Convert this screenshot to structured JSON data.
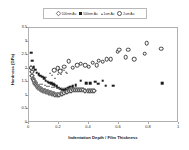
{
  "chart_data": {
    "type": "scatter",
    "title": "",
    "xlabel": "Indentation Depth / Film Thickness",
    "ylabel": "Hardness (GPa)",
    "xlim": [
      0,
      1
    ],
    "ylim": [
      0,
      3.5
    ],
    "grid": false,
    "legend_position": "top-center",
    "xticks": [
      "0",
      "0.2",
      "0.4",
      "0.6",
      "0.8",
      "1"
    ],
    "xtick_values": [
      0,
      0.2,
      0.4,
      0.6,
      0.8,
      1
    ],
    "yticks": [
      "0",
      "0.5",
      "1",
      "1.5",
      "2",
      "2.5",
      "3",
      "3.5"
    ],
    "ytick_values": [
      0,
      0.5,
      1,
      1.5,
      2,
      2.5,
      3,
      3.5
    ],
    "series": [
      {
        "name": "100nm Au",
        "marker": "open-diamond",
        "color": "#4a4a4a",
        "points": [
          [
            0.012,
            2.02
          ],
          [
            0.018,
            1.88
          ],
          [
            0.022,
            1.72
          ],
          [
            0.028,
            1.62
          ],
          [
            0.032,
            1.55
          ],
          [
            0.038,
            1.48
          ],
          [
            0.042,
            1.44
          ],
          [
            0.048,
            1.4
          ],
          [
            0.052,
            1.36
          ],
          [
            0.058,
            1.33
          ],
          [
            0.062,
            1.3
          ],
          [
            0.068,
            1.28
          ],
          [
            0.072,
            1.26
          ],
          [
            0.078,
            1.24
          ],
          [
            0.082,
            1.22
          ],
          [
            0.088,
            1.21
          ],
          [
            0.094,
            1.19
          ],
          [
            0.1,
            1.18
          ],
          [
            0.106,
            1.17
          ],
          [
            0.112,
            1.16
          ],
          [
            0.118,
            1.15
          ],
          [
            0.124,
            1.14
          ],
          [
            0.13,
            1.12
          ],
          [
            0.136,
            1.11
          ],
          [
            0.142,
            1.1
          ],
          [
            0.148,
            1.09
          ],
          [
            0.154,
            1.08
          ],
          [
            0.16,
            1.07
          ],
          [
            0.168,
            1.06
          ],
          [
            0.176,
            1.05
          ],
          [
            0.184,
            1.04
          ],
          [
            0.192,
            1.04
          ],
          [
            0.2,
            1.05
          ],
          [
            0.21,
            1.06
          ],
          [
            0.22,
            1.08
          ],
          [
            0.232,
            1.1
          ],
          [
            0.244,
            1.13
          ],
          [
            0.256,
            1.15
          ],
          [
            0.268,
            1.17
          ],
          [
            0.28,
            1.19
          ],
          [
            0.292,
            1.2
          ],
          [
            0.306,
            1.21
          ],
          [
            0.32,
            1.22
          ],
          [
            0.334,
            1.22
          ],
          [
            0.348,
            1.21
          ],
          [
            0.362,
            1.2
          ],
          [
            0.376,
            1.19
          ],
          [
            0.39,
            1.18
          ],
          [
            0.404,
            1.17
          ],
          [
            0.418,
            1.17
          ],
          [
            0.432,
            1.17
          ]
        ]
      },
      {
        "name": "500nm Au",
        "marker": "filled-square",
        "color": "#1c1c1c",
        "points": [
          [
            0.014,
            2.59
          ],
          [
            0.02,
            2.3
          ],
          [
            0.03,
            2.06
          ],
          [
            0.04,
            1.96
          ],
          [
            0.052,
            1.86
          ],
          [
            0.064,
            1.8
          ],
          [
            0.076,
            1.74
          ],
          [
            0.088,
            1.7
          ],
          [
            0.1,
            1.64
          ],
          [
            0.112,
            1.56
          ],
          [
            0.124,
            1.52
          ],
          [
            0.136,
            1.48
          ],
          [
            0.148,
            1.46
          ],
          [
            0.16,
            1.44
          ],
          [
            0.172,
            1.4
          ],
          [
            0.184,
            1.36
          ],
          [
            0.196,
            1.3
          ],
          [
            0.208,
            1.26
          ],
          [
            0.22,
            1.22
          ],
          [
            0.234,
            1.23
          ],
          [
            0.248,
            1.26
          ],
          [
            0.262,
            1.3
          ],
          [
            0.276,
            1.33
          ],
          [
            0.292,
            1.36
          ],
          [
            0.31,
            1.4
          ],
          [
            0.346,
            1.56
          ],
          [
            0.382,
            1.47
          ],
          [
            0.408,
            1.46
          ],
          [
            0.44,
            1.52
          ],
          [
            0.462,
            1.45
          ],
          [
            0.492,
            1.56
          ],
          [
            0.512,
            1.38
          ],
          [
            0.562,
            1.37
          ],
          [
            0.888,
            1.46
          ]
        ]
      },
      {
        "name": "1um Au",
        "marker": "open-triangle",
        "color": "#6b6b6b",
        "points": [
          [
            0.024,
            1.64
          ],
          [
            0.04,
            1.56
          ],
          [
            0.056,
            1.5
          ],
          [
            0.072,
            1.45
          ],
          [
            0.088,
            1.42
          ],
          [
            0.104,
            1.4
          ],
          [
            0.12,
            1.38
          ],
          [
            0.136,
            1.36
          ],
          [
            0.152,
            1.34
          ],
          [
            0.168,
            1.32
          ],
          [
            0.184,
            1.3
          ],
          [
            0.2,
            1.28
          ],
          [
            0.218,
            1.28
          ],
          [
            0.236,
            1.28
          ],
          [
            0.254,
            1.29
          ],
          [
            0.272,
            1.3
          ],
          [
            0.112,
            1.7
          ],
          [
            0.14,
            1.86
          ],
          [
            0.154,
            1.78
          ],
          [
            0.176,
            1.66
          ],
          [
            0.196,
            1.82
          ],
          [
            0.214,
            1.8
          ],
          [
            0.232,
            1.96
          ],
          [
            0.25,
            1.86
          ],
          [
            0.2,
            2.05
          ],
          [
            0.222,
            1.98
          ],
          [
            0.246,
            1.88
          ]
        ]
      },
      {
        "name": "2um Au",
        "marker": "open-circle",
        "color": "#3d3d3d",
        "points": [
          [
            0.236,
            2.08
          ],
          [
            0.264,
            2.28
          ],
          [
            0.292,
            2.04
          ],
          [
            0.32,
            2.12
          ],
          [
            0.346,
            2.18
          ],
          [
            0.374,
            2.12
          ],
          [
            0.398,
            2.08
          ],
          [
            0.424,
            2.22
          ],
          [
            0.452,
            2.14
          ],
          [
            0.464,
            2.3
          ],
          [
            0.492,
            2.26
          ],
          [
            0.518,
            2.34
          ],
          [
            0.546,
            2.36
          ],
          [
            0.592,
            2.62
          ],
          [
            0.6,
            2.7
          ],
          [
            0.646,
            2.42
          ],
          [
            0.66,
            2.7
          ],
          [
            0.7,
            2.36
          ],
          [
            0.77,
            2.56
          ],
          [
            0.784,
            2.94
          ],
          [
            0.88,
            2.74
          ],
          [
            0.168,
            1.94
          ],
          [
            0.192,
            2.02
          ],
          [
            0.208,
            1.9
          ]
        ]
      }
    ]
  }
}
